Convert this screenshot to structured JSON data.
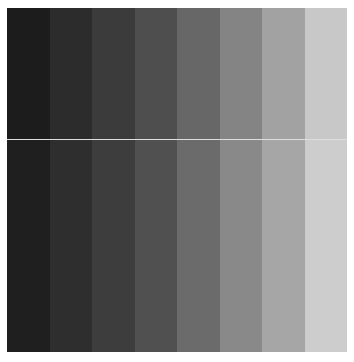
{
  "pattern": {
    "type": "grayscale-step-chart",
    "bands": [
      {
        "top": "#1c1c1c",
        "bottom": "#1f1f1f"
      },
      {
        "top": "#2c2c2c",
        "bottom": "#2e2e2e"
      },
      {
        "top": "#3b3b3b",
        "bottom": "#3d3d3d"
      },
      {
        "top": "#4e4e4e",
        "bottom": "#505050"
      },
      {
        "top": "#676767",
        "bottom": "#6b6b6b"
      },
      {
        "top": "#848484",
        "bottom": "#898989"
      },
      {
        "top": "#a2a2a2",
        "bottom": "#a6a6a6"
      },
      {
        "top": "#c8c8c8",
        "bottom": "#cdcdcd"
      }
    ],
    "divider_color": "#d0d0d0"
  }
}
